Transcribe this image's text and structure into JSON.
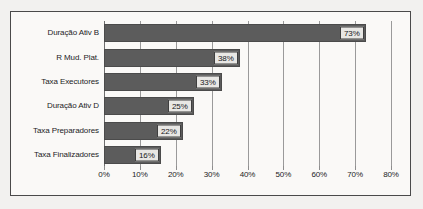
{
  "chart_data": {
    "type": "bar",
    "orientation": "horizontal",
    "title": "",
    "xlabel": "",
    "ylabel": "",
    "categories": [
      "Duração Ativ B",
      "R Mud. Plat.",
      "Taxa Executores",
      "Duração Ativ D",
      "Taxa Preparadores",
      "Taxa Finalizadores"
    ],
    "values": [
      73,
      38,
      33,
      25,
      22,
      16
    ],
    "value_labels": [
      "73%",
      "38%",
      "33%",
      "25%",
      "22%",
      "16%"
    ],
    "xlim": [
      0,
      80
    ],
    "xticks": [
      0,
      10,
      20,
      30,
      40,
      50,
      60,
      70,
      80
    ],
    "xtick_labels": [
      "0%",
      "10%",
      "20%",
      "30%",
      "40%",
      "50%",
      "60%",
      "70%",
      "80%"
    ],
    "grid": "vertical",
    "legend": "none",
    "colors": {
      "bar_fill": "#5c5c5c",
      "bar_border": "#4b4b4b",
      "gridline": "#9a9a9a",
      "label_box_fill": "#e8e7e4",
      "label_box_border": "#3f3f3f",
      "frame_border": "#4a4a4a",
      "plot_background": "#faf9f7",
      "page_background": "#f2f1ef",
      "text": "#1c1c1e"
    }
  }
}
